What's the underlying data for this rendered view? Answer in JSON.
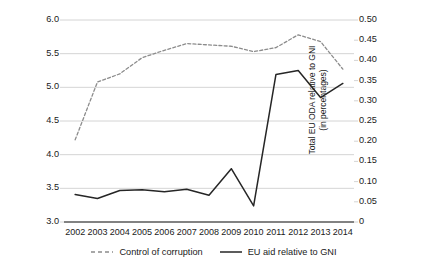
{
  "chart_data": {
    "type": "line",
    "title": "",
    "xlabel": "",
    "categories": [
      "2002",
      "2003",
      "2004",
      "2005",
      "2006",
      "2007",
      "2008",
      "2009",
      "2010",
      "2011",
      "2012",
      "2013",
      "2014"
    ],
    "grid": true,
    "legend_position": "bottom",
    "axes": {
      "left": {
        "label": "World Bank Control of Corruption\n(recoded 1–10 best)",
        "ticks": [
          "3.0",
          "3.5",
          "4.0",
          "4.5",
          "5.0",
          "5.5",
          "6.0"
        ],
        "tick_values": [
          3.0,
          3.5,
          4.0,
          4.5,
          5.0,
          5.5,
          6.0
        ],
        "ylim": [
          3.0,
          6.0
        ]
      },
      "right": {
        "label": "Total EU ODA relative to GNI\n(in percentages)",
        "ticks": [
          "0",
          "0.05",
          "0.10",
          "0.15",
          "0.20",
          "0.25",
          "0.30",
          "0.35",
          "0.40",
          "0.45",
          "0.50"
        ],
        "tick_values": [
          0,
          0.05,
          0.1,
          0.15,
          0.2,
          0.25,
          0.3,
          0.35,
          0.4,
          0.45,
          0.5
        ],
        "ylim": [
          0,
          0.5
        ]
      }
    },
    "series": [
      {
        "name": "Control of corruption",
        "axis": "left",
        "style": "dashed",
        "color": "#8c8c8c",
        "values": [
          4.22,
          5.08,
          5.2,
          5.44,
          5.55,
          5.65,
          5.63,
          5.61,
          5.53,
          5.59,
          5.78,
          5.68,
          5.27
        ]
      },
      {
        "name": "EU aid relative to GNI",
        "axis": "right",
        "style": "solid",
        "color": "#262626",
        "values": [
          0.068,
          0.058,
          0.078,
          0.08,
          0.075,
          0.081,
          0.066,
          0.132,
          0.04,
          0.365,
          0.375,
          0.308,
          0.343
        ]
      }
    ],
    "legend": [
      {
        "label": "Control of corruption",
        "style": "dashed"
      },
      {
        "label": "EU aid relative to GNI",
        "style": "solid"
      }
    ]
  },
  "colors": {
    "grid": "#c9c9c9",
    "axis": "#595959",
    "dashed_series": "#8c8c8c",
    "solid_series": "#262626",
    "background": "#ffffff"
  }
}
